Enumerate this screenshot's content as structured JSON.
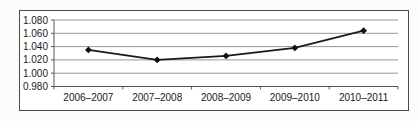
{
  "page": {
    "background": "#fcfcfc"
  },
  "chart_data": {
    "type": "line",
    "categories": [
      "2006–2007",
      "2007–2008",
      "2008–2009",
      "2009–2010",
      "2010–2011"
    ],
    "values": [
      1.035,
      1.02,
      1.026,
      1.038,
      1.064
    ],
    "series": [
      {
        "name": "index",
        "values": [
          1.035,
          1.02,
          1.026,
          1.038,
          1.064
        ]
      }
    ],
    "title": "",
    "xlabel": "",
    "ylabel": "",
    "ylim": [
      0.98,
      1.08
    ],
    "ytick_interval": 0.02,
    "ytick_labels": [
      "0.980",
      "1.000",
      "1.020",
      "1.040",
      "1.060",
      "1.080"
    ],
    "grid": true,
    "legend": "none",
    "marker": "diamond",
    "colors": {
      "line": "#1a1a1a",
      "marker": "#111111",
      "gridline": "#999999",
      "axis": "#555555",
      "tick_label": "#1a1a1a",
      "plot_background": "#ffffff",
      "frame_border": "#4a4a4a"
    }
  }
}
